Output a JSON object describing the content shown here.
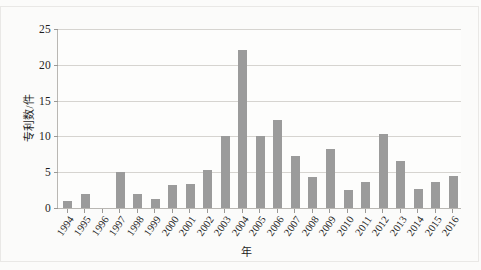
{
  "chart_data": {
    "type": "bar",
    "title": "",
    "subtitle": "",
    "xlabel": "年",
    "ylabel": "专利数/件",
    "categories": [
      "1994",
      "1995",
      "1996",
      "1997",
      "1998",
      "1999",
      "2000",
      "2001",
      "2002",
      "2003",
      "2004",
      "2005",
      "2006",
      "2007",
      "2008",
      "2009",
      "2010",
      "2011",
      "2012",
      "2013",
      "2014",
      "2015",
      "2016"
    ],
    "values": [
      1,
      2,
      0,
      5,
      2,
      1.3,
      3.2,
      3.4,
      5.3,
      10,
      22,
      10,
      12.3,
      7.3,
      4.4,
      8.2,
      2.5,
      3.7,
      10.3,
      6.5,
      2.7,
      3.6,
      4.5
    ],
    "series": [
      {
        "name": "专利数",
        "values": [
          1,
          2,
          0,
          5,
          2,
          1.3,
          3.2,
          3.4,
          5.3,
          10,
          22,
          10,
          12.3,
          7.3,
          4.4,
          8.2,
          2.5,
          3.7,
          10.3,
          6.5,
          2.7,
          3.6,
          4.5
        ]
      }
    ],
    "ylim": [
      0,
      25
    ],
    "yticks": [
      0,
      5,
      10,
      15,
      20,
      25
    ],
    "ytick_labels": [
      "0",
      "5",
      "10",
      "15",
      "20",
      "25"
    ],
    "grid": true,
    "grid_axis": "y",
    "legend": false,
    "legend_position": "none",
    "bar_color": "#9b9b9b",
    "gridline_color": "#d6d4d0",
    "axis_color": "#b9b7b3",
    "background_color": "#fbfbfa",
    "plot_background_color": "#fdfdfc",
    "text_color": "#1d1d1d",
    "xtick_rotation": -55
  }
}
